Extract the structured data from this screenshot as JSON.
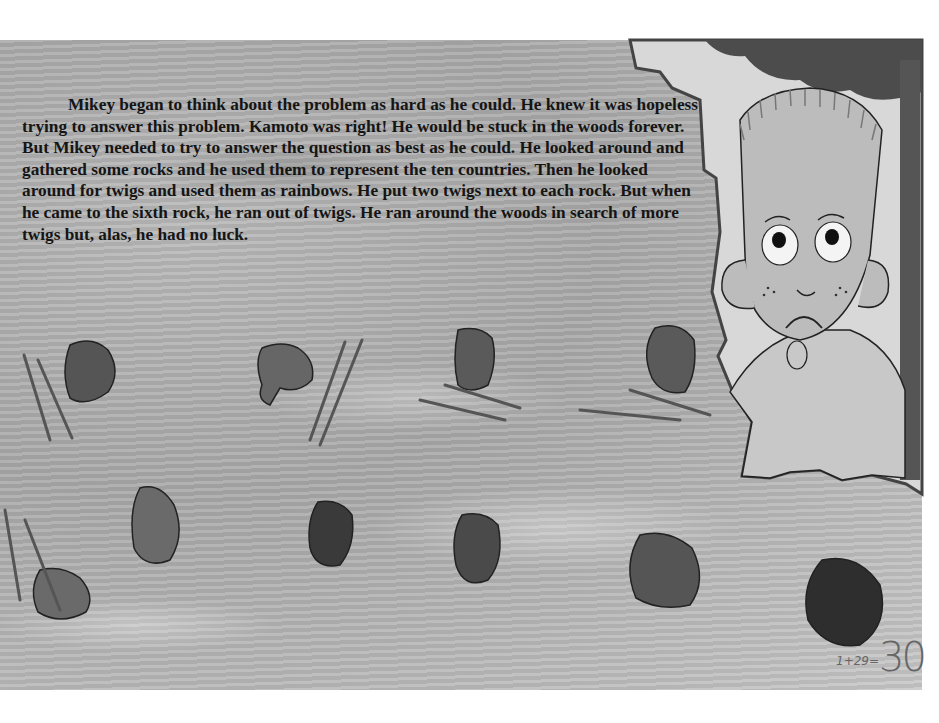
{
  "story": {
    "paragraph": "Mikey began to think about the problem as hard as he could.  He knew it was hopeless trying to answer this problem.  Kamoto was right!  He would be stuck in the woods forever.  But Mikey needed to try to answer the question as best as he could.  He looked around and gathered some rocks and he used them to represent the ten countries.  Then he looked around for twigs and used them as rainbows.  He put two twigs next to each rock.  But when he came to the sixth rock, he ran out of twigs.  He ran around the woods in search of more twigs but, alas, he had no luck."
  },
  "page_number": {
    "equation": "1+29=",
    "number": "30"
  },
  "illustration": {
    "character": "Mikey",
    "expression": "sad",
    "rocks_count": 10,
    "twig_pairs_count": 5
  }
}
